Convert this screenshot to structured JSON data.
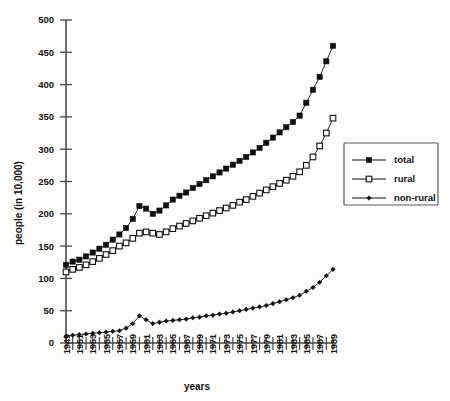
{
  "chart_data": {
    "type": "line",
    "title": "",
    "xlabel": "years",
    "ylabel": "people (in 10,000)",
    "ylim": [
      0,
      500
    ],
    "ytick_labels": [
      "0",
      "50",
      "100",
      "150",
      "200",
      "250",
      "300",
      "350",
      "400",
      "450",
      "500"
    ],
    "ytick_values": [
      0,
      50,
      100,
      150,
      200,
      250,
      300,
      350,
      400,
      450,
      500
    ],
    "x": [
      1949,
      1950,
      1951,
      1952,
      1953,
      1954,
      1955,
      1956,
      1957,
      1958,
      1959,
      1960,
      1961,
      1962,
      1963,
      1964,
      1965,
      1966,
      1967,
      1968,
      1969,
      1970,
      1971,
      1972,
      1973,
      1974,
      1975,
      1976,
      1977,
      1978,
      1979,
      1980,
      1981,
      1982,
      1983,
      1984,
      1985,
      1986,
      1987,
      1988,
      1989
    ],
    "xtick_labels": [
      "1949",
      "1951",
      "1953",
      "1955",
      "1957",
      "1959",
      "1961",
      "1963",
      "1965",
      "1967",
      "1969",
      "1971",
      "1973",
      "1975",
      "1977",
      "1979",
      "1981",
      "1983",
      "1985",
      "1987",
      "1989"
    ],
    "grid": false,
    "legend_position": "right",
    "series": [
      {
        "name": "total",
        "marker": "filled-square",
        "values": [
          121,
          126,
          129,
          134,
          140,
          146,
          152,
          160,
          168,
          178,
          192,
          212,
          208,
          200,
          205,
          213,
          222,
          228,
          233,
          240,
          246,
          252,
          258,
          264,
          270,
          276,
          282,
          288,
          295,
          302,
          310,
          318,
          326,
          334,
          342,
          352,
          372,
          392,
          412,
          436,
          460
        ]
      },
      {
        "name": "rural",
        "marker": "open-square",
        "values": [
          110,
          114,
          117,
          121,
          126,
          131,
          137,
          143,
          150,
          155,
          162,
          170,
          172,
          170,
          168,
          172,
          177,
          181,
          185,
          189,
          193,
          197,
          201,
          205,
          209,
          213,
          218,
          222,
          227,
          232,
          237,
          242,
          247,
          252,
          258,
          265,
          275,
          288,
          305,
          325,
          348
        ]
      },
      {
        "name": "non-rural",
        "marker": "small-filled-diamond",
        "values": [
          10,
          12,
          13,
          14,
          15,
          16,
          17,
          18,
          19,
          23,
          30,
          42,
          36,
          30,
          32,
          34,
          35,
          36,
          37,
          39,
          40,
          42,
          43,
          45,
          46,
          48,
          50,
          52,
          54,
          56,
          58,
          61,
          64,
          67,
          70,
          74,
          80,
          86,
          94,
          104,
          114
        ]
      }
    ]
  },
  "legend": {
    "items": [
      {
        "label": "total"
      },
      {
        "label": "rural"
      },
      {
        "label": "non-rural"
      }
    ]
  },
  "colors": {
    "ink": "#111111",
    "axis": "#4a4a4a",
    "background": "#fdfdfb"
  }
}
